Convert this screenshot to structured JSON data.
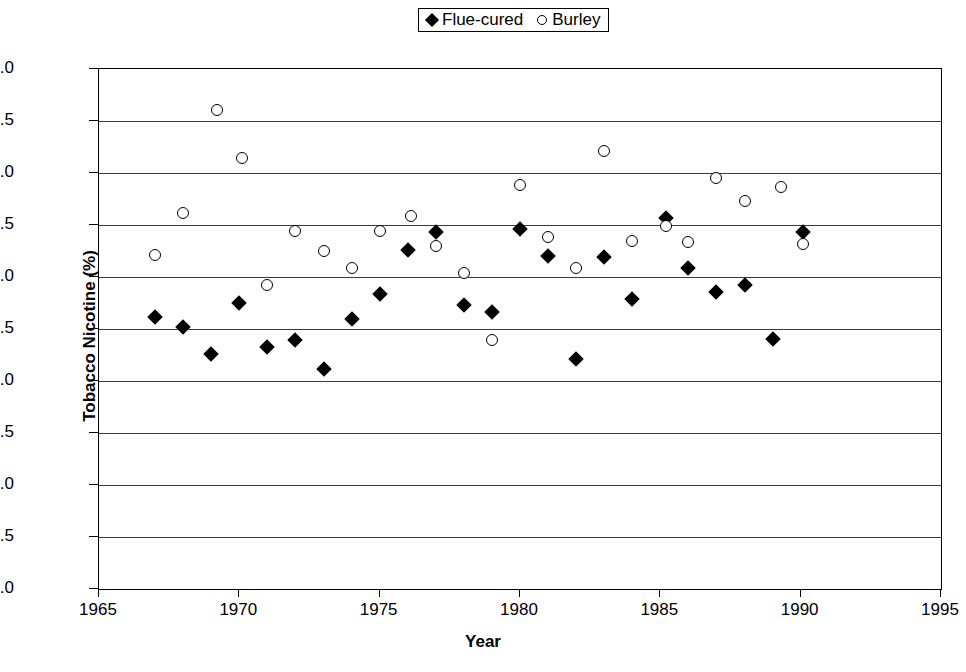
{
  "chart_data": {
    "type": "scatter",
    "title": "",
    "xlabel": "Year",
    "ylabel": "Tobacco Nicotine (%)",
    "xlim": [
      1965,
      1995
    ],
    "ylim": [
      0.0,
      5.0
    ],
    "xticks": [
      "1965",
      "1970",
      "1975",
      "1980",
      "1985",
      "1990",
      "1995"
    ],
    "yticks": [
      "0.0",
      "0.5",
      "1.0",
      "1.5",
      "2.0",
      "2.5",
      "3.0",
      "3.5",
      "4.0",
      "4.5",
      "5.0"
    ],
    "grid": "horizontal",
    "legend_position": "top-center",
    "legend": [
      {
        "name": "Flue-cured",
        "marker": "filled-diamond"
      },
      {
        "name": "Burley",
        "marker": "open-circle"
      }
    ],
    "series": [
      {
        "name": "Flue-cured",
        "marker": "filled-diamond",
        "points": [
          {
            "x": 1967.0,
            "y": 2.62
          },
          {
            "x": 1968.0,
            "y": 2.52
          },
          {
            "x": 1969.0,
            "y": 2.26
          },
          {
            "x": 1970.0,
            "y": 2.75
          },
          {
            "x": 1971.0,
            "y": 2.33
          },
          {
            "x": 1972.0,
            "y": 2.39
          },
          {
            "x": 1973.0,
            "y": 2.12
          },
          {
            "x": 1974.0,
            "y": 2.6
          },
          {
            "x": 1975.0,
            "y": 2.84
          },
          {
            "x": 1976.0,
            "y": 3.26
          },
          {
            "x": 1977.0,
            "y": 3.43
          },
          {
            "x": 1978.0,
            "y": 2.73
          },
          {
            "x": 1979.0,
            "y": 2.66
          },
          {
            "x": 1980.0,
            "y": 3.46
          },
          {
            "x": 1981.0,
            "y": 3.2
          },
          {
            "x": 1982.0,
            "y": 2.21
          },
          {
            "x": 1983.0,
            "y": 3.19
          },
          {
            "x": 1984.0,
            "y": 2.79
          },
          {
            "x": 1985.2,
            "y": 3.57
          },
          {
            "x": 1986.0,
            "y": 3.09
          },
          {
            "x": 1987.0,
            "y": 2.86
          },
          {
            "x": 1988.0,
            "y": 2.92
          },
          {
            "x": 1989.0,
            "y": 2.4
          },
          {
            "x": 1990.1,
            "y": 3.43
          }
        ]
      },
      {
        "name": "Burley",
        "marker": "open-circle",
        "points": [
          {
            "x": 1967.0,
            "y": 3.21
          },
          {
            "x": 1968.0,
            "y": 3.62
          },
          {
            "x": 1969.2,
            "y": 4.61
          },
          {
            "x": 1970.1,
            "y": 4.14
          },
          {
            "x": 1971.0,
            "y": 2.92
          },
          {
            "x": 1972.0,
            "y": 3.44
          },
          {
            "x": 1973.0,
            "y": 3.25
          },
          {
            "x": 1974.0,
            "y": 3.09
          },
          {
            "x": 1975.0,
            "y": 3.44
          },
          {
            "x": 1976.1,
            "y": 3.59
          },
          {
            "x": 1977.0,
            "y": 3.3
          },
          {
            "x": 1978.0,
            "y": 3.04
          },
          {
            "x": 1979.0,
            "y": 2.39
          },
          {
            "x": 1980.0,
            "y": 3.88
          },
          {
            "x": 1981.0,
            "y": 3.38
          },
          {
            "x": 1982.0,
            "y": 3.09
          },
          {
            "x": 1983.0,
            "y": 4.21
          },
          {
            "x": 1984.0,
            "y": 3.35
          },
          {
            "x": 1985.2,
            "y": 3.49
          },
          {
            "x": 1986.0,
            "y": 3.34
          },
          {
            "x": 1987.0,
            "y": 3.95
          },
          {
            "x": 1988.0,
            "y": 3.73
          },
          {
            "x": 1989.3,
            "y": 3.87
          },
          {
            "x": 1990.1,
            "y": 3.32
          }
        ]
      }
    ]
  },
  "axes": {
    "x_title": "Year",
    "y_title": "Tobacco Nicotine (%)"
  },
  "legend": {
    "flue_label": "Flue-cured",
    "burley_label": "Burley"
  },
  "colors": {
    "marker": "#000000",
    "grid": "#3a3a3a",
    "frame": "#000000",
    "background": "#ffffff"
  }
}
